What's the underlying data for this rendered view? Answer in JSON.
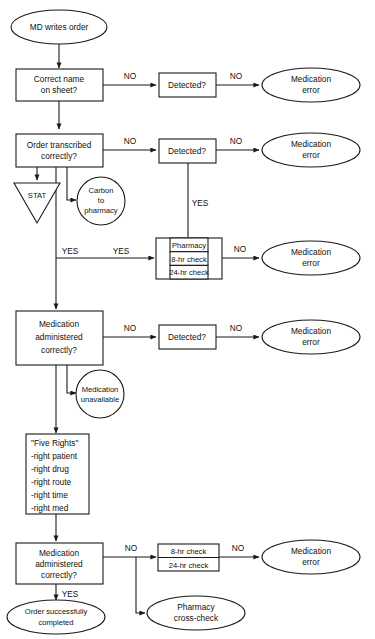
{
  "diagram": {
    "colors": {
      "stroke": "#1a1a1a",
      "fill": "#ffffff",
      "text": "#111111"
    },
    "nodes": [
      {
        "id": "start",
        "shape": "ellipse",
        "lines": [
          "MD writes order"
        ]
      },
      {
        "id": "correct_name",
        "shape": "rect",
        "lines": [
          "Correct name",
          "on sheet?"
        ]
      },
      {
        "id": "detected1",
        "shape": "rect",
        "lines": [
          "Detected?"
        ]
      },
      {
        "id": "med_error1",
        "shape": "ellipse",
        "lines": [
          "Medication",
          "error"
        ]
      },
      {
        "id": "transcribed",
        "shape": "rect",
        "lines": [
          "Order transcribed",
          "correctly?"
        ]
      },
      {
        "id": "detected2",
        "shape": "rect",
        "lines": [
          "Detected?"
        ]
      },
      {
        "id": "med_error2",
        "shape": "ellipse",
        "lines": [
          "Medication",
          "error"
        ]
      },
      {
        "id": "stat",
        "shape": "triangle",
        "lines": [
          "STAT"
        ]
      },
      {
        "id": "carbon",
        "shape": "circle",
        "lines": [
          "Carbon",
          "to",
          "pharmacy"
        ]
      },
      {
        "id": "pharmacy_box",
        "shape": "table",
        "lines": [
          "Pharmacy",
          "8-hr check",
          "24-hr check"
        ]
      },
      {
        "id": "med_error3",
        "shape": "ellipse",
        "lines": [
          "Medication",
          "error"
        ]
      },
      {
        "id": "administered1",
        "shape": "rect",
        "lines": [
          "Medication",
          "administered",
          "correctly?"
        ]
      },
      {
        "id": "detected3",
        "shape": "rect",
        "lines": [
          "Detected?"
        ]
      },
      {
        "id": "med_error4",
        "shape": "ellipse",
        "lines": [
          "Medication",
          "error"
        ]
      },
      {
        "id": "unavailable",
        "shape": "circle",
        "lines": [
          "Medication",
          "unavailable"
        ]
      },
      {
        "id": "five_rights",
        "shape": "rect",
        "lines": [
          "\"Five Rights\"",
          "-right patient",
          "-right drug",
          "-right route",
          "-right time",
          "-right med"
        ]
      },
      {
        "id": "administered2",
        "shape": "rect",
        "lines": [
          "Medication",
          "administered",
          "correctly?"
        ]
      },
      {
        "id": "checks_box",
        "shape": "table",
        "lines": [
          "8-hr check",
          "24-hr check"
        ]
      },
      {
        "id": "med_error5",
        "shape": "ellipse",
        "lines": [
          "Medication",
          "error"
        ]
      },
      {
        "id": "success",
        "shape": "ellipse",
        "lines": [
          "Order successfully",
          "completed"
        ]
      },
      {
        "id": "crosscheck",
        "shape": "ellipse",
        "lines": [
          "Pharmacy",
          "cross-check"
        ]
      }
    ],
    "edge_labels": [
      {
        "id": "no1",
        "text": "NO"
      },
      {
        "id": "no2",
        "text": "NO"
      },
      {
        "id": "no3",
        "text": "NO"
      },
      {
        "id": "no4",
        "text": "NO"
      },
      {
        "id": "yes1",
        "text": "YES"
      },
      {
        "id": "yes2",
        "text": "YES"
      },
      {
        "id": "yes3",
        "text": "YES"
      },
      {
        "id": "no5",
        "text": "NO"
      },
      {
        "id": "no6",
        "text": "NO"
      },
      {
        "id": "no7",
        "text": "NO"
      },
      {
        "id": "no8",
        "text": "NO"
      },
      {
        "id": "yes4",
        "text": "YES"
      },
      {
        "id": "no9",
        "text": "NO"
      },
      {
        "id": "no10",
        "text": "NO"
      }
    ]
  }
}
